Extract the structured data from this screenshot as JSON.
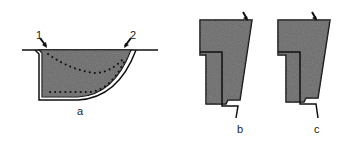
{
  "figure": {
    "panels": [
      {
        "id": "a",
        "caption": "a",
        "markers": [
          "1",
          "2"
        ]
      },
      {
        "id": "b",
        "caption": "b"
      },
      {
        "id": "c",
        "caption": "c"
      }
    ]
  },
  "colors": {
    "fill": "#6a6a6a",
    "outline": "#111111",
    "background": "#ffffff"
  }
}
